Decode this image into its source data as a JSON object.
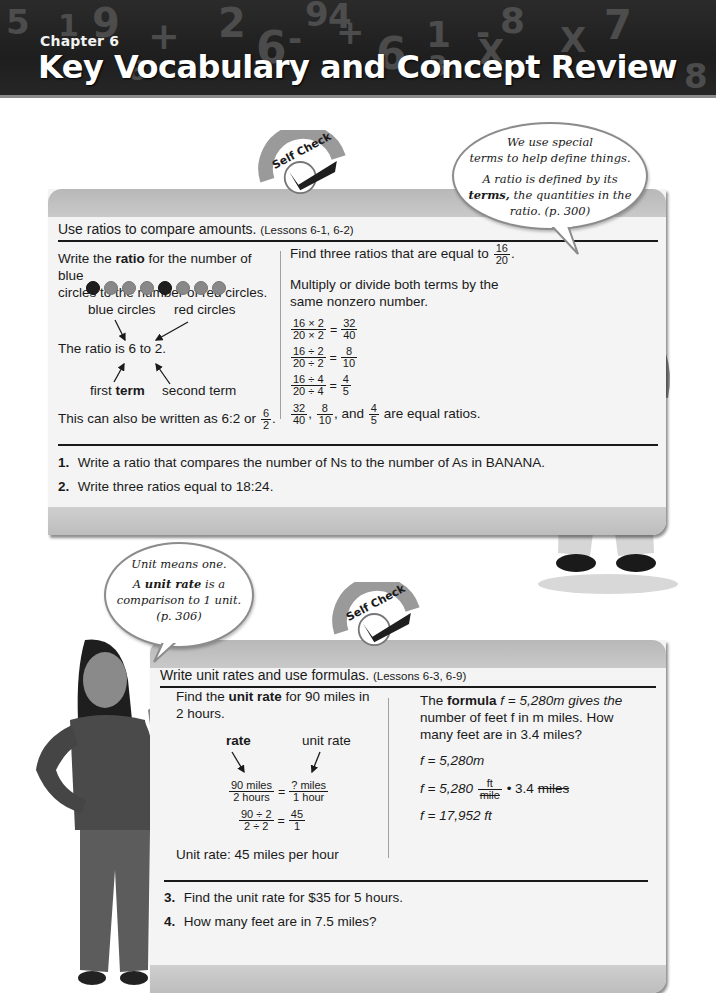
{
  "header": {
    "chapter": "Chapter 6",
    "title": "Key Vocabulary and Concept Review",
    "background_glyphs": [
      "5",
      "1",
      "9",
      "+",
      "8",
      "2",
      "6",
      "-",
      "9",
      "4",
      "+",
      "6",
      "1",
      "-",
      "8",
      "X",
      "7",
      "3",
      "8",
      "X"
    ]
  },
  "badge": {
    "label": "Self Check"
  },
  "bubble_top": {
    "line1": "We use special",
    "line2": "terms to help define things.",
    "line3": "A ratio is defined by its",
    "line4_bold": "terms,",
    "line4_rest": "the quantities in the",
    "line5": "ratio. (p. 300)"
  },
  "panel1": {
    "heading": "Use ratios to compare amounts.",
    "lessons": "(Lessons 6-1, 6-2)",
    "left": {
      "line1_pre": "Write the",
      "line1_bold": "ratio",
      "line1_post": "for the number of blue",
      "line2": "circles to the number of red circles.",
      "circles": [
        "red",
        "blue",
        "blue",
        "blue",
        "red",
        "blue",
        "blue",
        "blue"
      ],
      "label_blue": "blue circles",
      "label_red": "red circles",
      "ratio_sentence": "The ratio is 6 to 2.",
      "label_first_pre": "first",
      "label_first_bold": "term",
      "label_second": "second term",
      "also_written": "This can also be written as 6:2 or",
      "frac_n": "6",
      "frac_d": "2",
      "period": "."
    },
    "right": {
      "find_text": "Find three ratios that are equal to",
      "find_frac_n": "16",
      "find_frac_d": "20",
      "period": ".",
      "multiply_line1": "Multiply or divide both terms by the",
      "multiply_line2": "same nonzero number.",
      "equations": [
        {
          "ln": "16 × 2",
          "ld": "20 × 2",
          "rn": "32",
          "rd": "40"
        },
        {
          "ln": "16 ÷ 2",
          "ld": "20 ÷ 2",
          "rn": "8",
          "rd": "10"
        },
        {
          "ln": "16 ÷ 4",
          "ld": "20 ÷ 4",
          "rn": "4",
          "rd": "5"
        }
      ],
      "equals": "=",
      "summary": {
        "f1n": "32",
        "f1d": "40",
        "sep1": ",",
        "f2n": "8",
        "f2d": "10",
        "sep2": ", and",
        "f3n": "4",
        "f3d": "5",
        "tail": "are equal ratios."
      }
    },
    "exercises": [
      {
        "num": "1.",
        "text": "Write a ratio that compares the number of Ns to the number of As in BANANA."
      },
      {
        "num": "2.",
        "text": "Write three ratios equal to 18:24."
      }
    ]
  },
  "bubble_bottom": {
    "line1": "Unit means one.",
    "line2_pre": "A",
    "line2_bold": "unit rate",
    "line2_post": "is a",
    "line3": "comparison to 1 unit.",
    "line4": "(p. 306)"
  },
  "panel2": {
    "heading": "Write unit rates and use formulas.",
    "lessons": "(Lessons 6-3, 6-9)",
    "left": {
      "line1_pre": "Find the",
      "line1_bold": "unit rate",
      "line1_post": "for 90 miles in",
      "line2": "2 hours.",
      "label_rate": "rate",
      "label_unit_rate": "unit rate",
      "eq1": {
        "ln": "90 miles",
        "ld": "2 hours",
        "rn": "? miles",
        "rd": "1 hour"
      },
      "eq2": {
        "ln": "90 ÷ 2",
        "ld": "2 ÷ 2",
        "rn": "45",
        "rd": "1"
      },
      "equals": "=",
      "result": "Unit rate: 45 miles per hour"
    },
    "right": {
      "line1_pre": "The",
      "line1_bold": "formula",
      "line1_post": "f = 5,280m gives the",
      "line2": "number of feet f in m miles. How",
      "line3": "many feet are in 3.4 miles?",
      "step1": "f = 5,280m",
      "step2_pre": "f = 5,280",
      "step2_fn": "ft",
      "step2_fd": "mile",
      "step2_post": "• 3.4",
      "step2_struck": "miles",
      "step3": "f = 17,952 ft"
    },
    "exercises": [
      {
        "num": "3.",
        "text": "Find the unit rate for $35 for 5 hours."
      },
      {
        "num": "4.",
        "text": "How many feet are in 7.5 miles?"
      }
    ]
  },
  "colors": {
    "banner_bg": "#222222",
    "panel_bg": "#f4f4f4",
    "panel_band": "#c4c4c4",
    "text": "#1a1a1a"
  }
}
